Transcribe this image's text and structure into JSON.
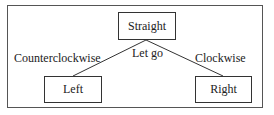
{
  "diagram": {
    "nodes": {
      "top": "Straight",
      "left": "Left",
      "right": "Right"
    },
    "edges": {
      "left": "Counterclockwise",
      "center": "Let go",
      "right": "Clockwise"
    },
    "colors": {
      "line": "#333333",
      "border": "#555555"
    }
  }
}
